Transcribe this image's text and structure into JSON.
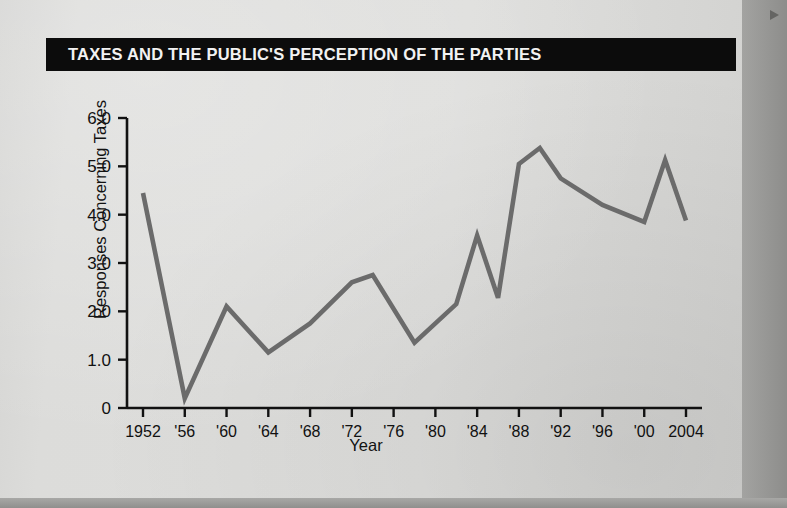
{
  "banner": {
    "title": "TAXES AND THE PUBLIC'S PERCEPTION OF THE PARTIES"
  },
  "colors": {
    "banner_background": "#0c0c0c",
    "banner_text": "#f2f2f2",
    "page_background": "#dcdcda",
    "axis": "#111111",
    "line": "#6b6b6b",
    "outer_background": "#9b9b9b"
  },
  "chart_data": {
    "type": "line",
    "title": "TAXES AND THE PUBLIC'S PERCEPTION OF THE PARTIES",
    "xlabel": "Year",
    "ylabel": "Responses Concerning Taxes",
    "xlim": [
      1952,
      2004
    ],
    "ylim": [
      0,
      6.0
    ],
    "grid": false,
    "legend": null,
    "ytick_labels": [
      "0",
      "1.0",
      "2.0",
      "3.0",
      "4.0",
      "5.0",
      "6.0"
    ],
    "ytick_values": [
      0,
      1.0,
      2.0,
      3.0,
      4.0,
      5.0,
      6.0
    ],
    "xtick_labels": [
      "1952",
      "'56",
      "'60",
      "'64",
      "'68",
      "'72",
      "'76",
      "'80",
      "'84",
      "'88",
      "'92",
      "'96",
      "'00",
      "2004"
    ],
    "xtick_values": [
      1952,
      1956,
      1960,
      1964,
      1968,
      1972,
      1976,
      1980,
      1984,
      1988,
      1992,
      1996,
      2000,
      2004
    ],
    "x": [
      1952,
      1956,
      1960,
      1964,
      1968,
      1972,
      1974,
      1978,
      1980,
      1982,
      1984,
      1986,
      1988,
      1990,
      1992,
      1996,
      2000,
      2002,
      2004
    ],
    "values": [
      4.45,
      0.2,
      2.1,
      1.15,
      1.75,
      2.6,
      2.75,
      1.35,
      1.75,
      2.15,
      3.57,
      2.28,
      5.05,
      5.38,
      4.75,
      4.2,
      3.85,
      5.13,
      3.88
    ],
    "series": [
      {
        "name": "Responses Concerning Taxes",
        "points": [
          {
            "x": 1952,
            "y": 4.45
          },
          {
            "x": 1956,
            "y": 0.2
          },
          {
            "x": 1960,
            "y": 2.1
          },
          {
            "x": 1964,
            "y": 1.15
          },
          {
            "x": 1968,
            "y": 1.75
          },
          {
            "x": 1972,
            "y": 2.6
          },
          {
            "x": 1974,
            "y": 2.75
          },
          {
            "x": 1978,
            "y": 1.35
          },
          {
            "x": 1980,
            "y": 1.75
          },
          {
            "x": 1982,
            "y": 2.15
          },
          {
            "x": 1984,
            "y": 3.57
          },
          {
            "x": 1986,
            "y": 2.28
          },
          {
            "x": 1988,
            "y": 5.05
          },
          {
            "x": 1990,
            "y": 5.38
          },
          {
            "x": 1992,
            "y": 4.75
          },
          {
            "x": 1996,
            "y": 4.2
          },
          {
            "x": 2000,
            "y": 3.85
          },
          {
            "x": 2002,
            "y": 5.13
          },
          {
            "x": 2004,
            "y": 3.88
          }
        ]
      }
    ]
  }
}
